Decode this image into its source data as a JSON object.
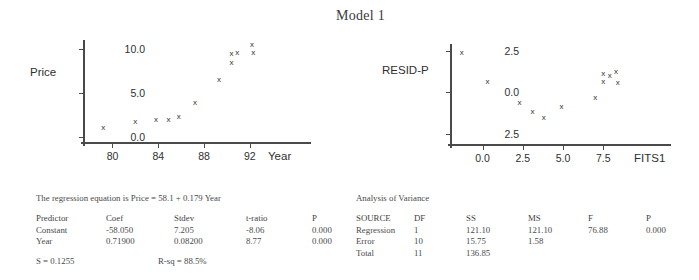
{
  "title": "Model 1",
  "chart_data": [
    {
      "type": "scatter",
      "name": "price-vs-year",
      "title": "",
      "xlabel": "Year",
      "ylabel": "Price",
      "xticks": [
        80,
        84,
        88,
        92
      ],
      "yticks": [
        0.0,
        5.0,
        10.0
      ],
      "xtick_labels": [
        "80",
        "84",
        "88",
        "92"
      ],
      "ytick_labels": [
        "0.0",
        "5.0",
        "10.0"
      ],
      "xlim": [
        77.6,
        94.2
      ],
      "ylim": [
        -0.6,
        11.0
      ],
      "grid": false,
      "marker": "x",
      "x": [
        79.2,
        82.0,
        83.8,
        84.9,
        85.8,
        87.2,
        89.3,
        90.4,
        90.4,
        90.9,
        92.2,
        92.3
      ],
      "y": [
        1.0,
        1.7,
        1.9,
        1.9,
        2.2,
        3.8,
        6.5,
        9.4,
        8.4,
        9.5,
        10.4,
        9.5
      ]
    },
    {
      "type": "scatter",
      "name": "resid-vs-fits",
      "title": "",
      "xlabel": "FITS1",
      "ylabel": "RESID-P",
      "xticks": [
        0.0,
        2.5,
        5.0,
        7.5
      ],
      "yticks": [
        -2.5,
        0.0,
        2.5
      ],
      "xtick_labels": [
        "0.0",
        "2.5",
        "5.0",
        "7.5"
      ],
      "ytick_labels": [
        "2.5",
        "0.0",
        "2.5"
      ],
      "xlim": [
        -1.9,
        9.6
      ],
      "ylim": [
        -3.1,
        2.9
      ],
      "grid": false,
      "marker": "x",
      "x": [
        -1.3,
        0.3,
        2.3,
        3.1,
        3.8,
        4.9,
        7.0,
        7.5,
        7.5,
        7.9,
        8.3,
        8.4
      ],
      "y": [
        2.35,
        0.65,
        -0.65,
        -1.15,
        -1.55,
        -0.85,
        -0.35,
        1.1,
        0.65,
        1.0,
        1.2,
        0.55
      ]
    }
  ],
  "regression": {
    "equation": "The regression equation is Price = 58.1 + 0.179 Year",
    "headers": [
      "Predictor",
      "Coef",
      "Stdev",
      "t-ratio",
      "P"
    ],
    "rows": [
      [
        "Constant",
        "-58.050",
        "7.205",
        "-8.06",
        "0.000"
      ],
      [
        "Year",
        "0.71900",
        "0.08200",
        "8.77",
        "0.000"
      ]
    ],
    "s_label": "S = 0.1255",
    "rsq_label": "R-sq = 88.5%"
  },
  "anova": {
    "caption": "Analysis of Variance",
    "headers": [
      "SOURCE",
      "DF",
      "SS",
      "MS",
      "F",
      "P"
    ],
    "rows": [
      [
        "Regression",
        "1",
        "121.10",
        "121.10",
        "76.88",
        "0.000"
      ],
      [
        "Error",
        "10",
        "15.75",
        "1.58",
        "",
        ""
      ],
      [
        "Total",
        "11",
        "136.85",
        "",
        "",
        ""
      ]
    ]
  }
}
